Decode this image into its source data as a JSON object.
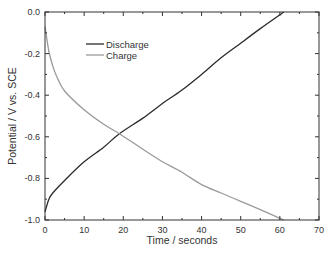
{
  "chart_data": {
    "type": "line",
    "title": "",
    "xlabel": "Time / seconds",
    "ylabel": "Potential / V vs. SCE",
    "xlim": [
      0,
      70
    ],
    "ylim": [
      -1.0,
      0.0
    ],
    "xticks": [
      0,
      10,
      20,
      30,
      40,
      50,
      60,
      70
    ],
    "xtick_labels": [
      "0",
      "10",
      "20",
      "30",
      "40",
      "50",
      "60",
      "70"
    ],
    "yticks": [
      0.0,
      -0.2,
      -0.4,
      -0.6,
      -0.8,
      -1.0
    ],
    "ytick_labels": [
      "0.0",
      "-0.2",
      "-0.4",
      "-0.6",
      "-0.8",
      "-1.0"
    ],
    "grid": false,
    "legend_position": "upper-left-inside",
    "series": [
      {
        "name": "Discharge",
        "color": "#2b2b2b",
        "x": [
          0,
          1,
          2,
          5,
          10,
          15,
          19,
          25,
          30,
          35,
          40,
          45,
          50,
          55,
          61
        ],
        "y": [
          -0.96,
          -0.9,
          -0.87,
          -0.81,
          -0.72,
          -0.65,
          -0.585,
          -0.51,
          -0.44,
          -0.375,
          -0.3,
          -0.22,
          -0.15,
          -0.08,
          0.0
        ]
      },
      {
        "name": "Charge",
        "color": "#9a9a9a",
        "x": [
          0,
          1,
          2,
          3,
          5,
          10,
          15,
          19,
          25,
          30,
          35,
          40,
          45,
          50,
          55,
          61
        ],
        "y": [
          -0.07,
          -0.19,
          -0.26,
          -0.31,
          -0.38,
          -0.47,
          -0.54,
          -0.585,
          -0.66,
          -0.72,
          -0.77,
          -0.83,
          -0.87,
          -0.91,
          -0.95,
          -1.0
        ]
      }
    ]
  }
}
